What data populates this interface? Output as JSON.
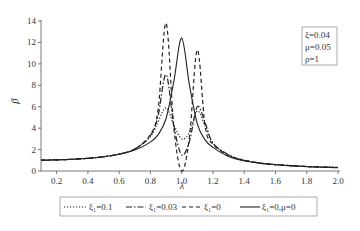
{
  "chart_data": {
    "type": "line",
    "title": "",
    "xlabel": "λ",
    "ylabel": "β",
    "xlim": [
      0.1,
      2.0
    ],
    "ylim": [
      0,
      14
    ],
    "xticks": [
      "0.2",
      "0.4",
      "0.6",
      "0.8",
      "1.0",
      "1.2",
      "1.4",
      "1.6",
      "1.8",
      "2.0"
    ],
    "yticks": [
      "0",
      "2",
      "4",
      "6",
      "8",
      "10",
      "12",
      "14"
    ],
    "grid": false,
    "legend_position": "bottom",
    "annotation": [
      "ξ=0.04",
      "μ=0.05",
      "ρ=1"
    ],
    "x": [
      0.1,
      0.2,
      0.3,
      0.4,
      0.5,
      0.6,
      0.7,
      0.8,
      0.85,
      0.9,
      0.95,
      1.0,
      1.05,
      1.1,
      1.15,
      1.2,
      1.3,
      1.4,
      1.5,
      1.6,
      1.8,
      2.0
    ],
    "series": [
      {
        "name": "ξ1=0.1",
        "style": "dotted",
        "values": [
          1.01,
          1.04,
          1.09,
          1.18,
          1.33,
          1.58,
          2.05,
          3.2,
          4.6,
          5.9,
          4.3,
          3.0,
          3.6,
          5.6,
          4.2,
          2.6,
          1.5,
          1.0,
          0.75,
          0.6,
          0.42,
          0.33
        ]
      },
      {
        "name": "ξ1=0.03",
        "style": "dash-dot",
        "values": [
          1.01,
          1.04,
          1.09,
          1.18,
          1.33,
          1.58,
          2.05,
          3.3,
          5.2,
          9.0,
          4.2,
          1.5,
          2.8,
          6.0,
          4.5,
          2.6,
          1.5,
          1.0,
          0.75,
          0.6,
          0.42,
          0.33
        ]
      },
      {
        "name": "ξ1=0",
        "style": "dashed",
        "values": [
          1.01,
          1.04,
          1.09,
          1.18,
          1.33,
          1.58,
          2.05,
          3.4,
          5.8,
          13.8,
          4.0,
          0.0,
          3.2,
          11.3,
          4.2,
          2.5,
          1.45,
          1.0,
          0.75,
          0.6,
          0.42,
          0.33
        ]
      },
      {
        "name": "ξ1=0,μ=0",
        "style": "solid",
        "values": [
          1.01,
          1.04,
          1.1,
          1.19,
          1.33,
          1.56,
          1.95,
          2.7,
          3.4,
          4.9,
          8.4,
          12.4,
          8.0,
          4.4,
          2.9,
          2.2,
          1.35,
          0.95,
          0.72,
          0.58,
          0.4,
          0.32
        ]
      }
    ]
  },
  "legend": {
    "items": [
      {
        "label": "ξ₁=0.1"
      },
      {
        "label": "ξ₁=0.03"
      },
      {
        "label": "ξ₁=0"
      },
      {
        "label": "ξ₁=0,μ=0"
      }
    ]
  },
  "annotation_box": {
    "line1": "ξ=0.04",
    "line2": "μ=0.05",
    "line3": "ρ=1"
  },
  "axes": {
    "xlabel": "λ",
    "ylabel": "β"
  }
}
